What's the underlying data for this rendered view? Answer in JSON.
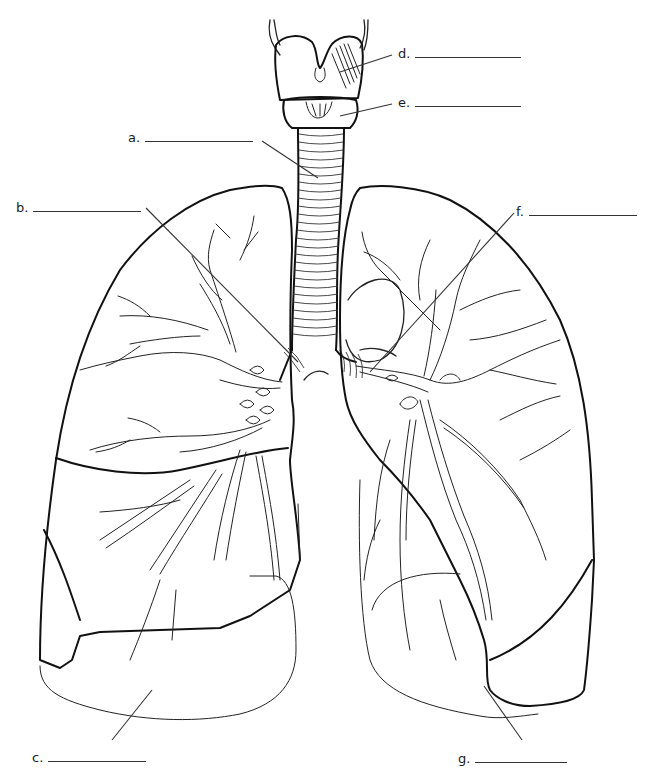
{
  "diagram": {
    "labels": [
      {
        "id": "a",
        "text": "a.",
        "blank": "",
        "x": 128,
        "y": 137,
        "line_width": 108
      },
      {
        "id": "b",
        "text": "b.",
        "blank": "",
        "x": 16,
        "y": 207,
        "line_width": 108
      },
      {
        "id": "c",
        "text": "c.",
        "blank": "",
        "x": 32,
        "y": 757,
        "line_width": 98
      },
      {
        "id": "d",
        "text": "d.",
        "blank": "",
        "x": 398,
        "y": 51,
        "line_width": 106
      },
      {
        "id": "e",
        "text": "e.",
        "blank": "",
        "x": 398,
        "y": 100,
        "line_width": 106
      },
      {
        "id": "f",
        "text": "f.",
        "blank": "",
        "x": 516,
        "y": 209,
        "line_width": 108
      },
      {
        "id": "g",
        "text": "g.",
        "blank": "",
        "x": 458,
        "y": 758,
        "line_width": 92
      }
    ],
    "structures": [
      "larynx",
      "thyroid-cartilage",
      "cricoid-cartilage",
      "trachea",
      "right-lung",
      "left-lung",
      "bronchial-tree",
      "heart-notch"
    ]
  }
}
